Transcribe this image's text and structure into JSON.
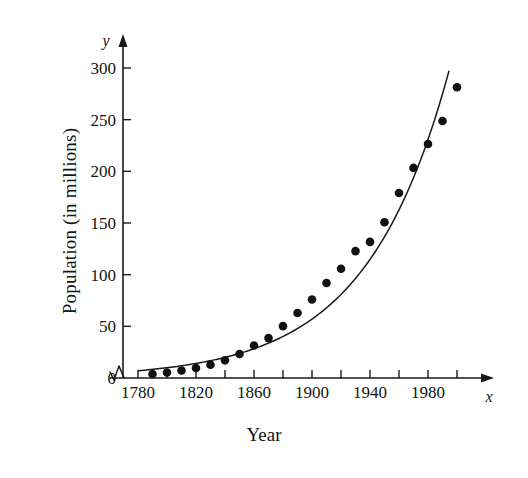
{
  "figure": {
    "background_color": "#ffffff",
    "ink_color": "#1a1a1a",
    "axis_variable_x": "x",
    "axis_variable_y": "y",
    "x_axis_title": "Year",
    "y_axis_title": "Population (in millions)"
  },
  "chart_data": {
    "type": "scatter",
    "title": "",
    "subtitle": "",
    "xlabel": "Year",
    "ylabel": "Population (in millions)",
    "xlim": [
      1780,
      2005
    ],
    "ylim": [
      0,
      310
    ],
    "grid": false,
    "legend": "none",
    "axis_break_x": true,
    "x_tick_labels": [
      "1780",
      "1820",
      "1860",
      "1900",
      "1940",
      "1980"
    ],
    "x_major_ticks": [
      1780,
      1820,
      1860,
      1900,
      1940,
      1980
    ],
    "x_minor_ticks": [
      1800,
      1820,
      1840,
      1860,
      1880,
      1900,
      1920,
      1940,
      1960,
      1980,
      2000
    ],
    "x_tick_interval": 20,
    "y_tick_labels": [
      "0",
      "50",
      "100",
      "150",
      "200",
      "250",
      "300"
    ],
    "y_ticks": [
      0,
      50,
      100,
      150,
      200,
      250,
      300
    ],
    "y_tick_interval": 50,
    "series": [
      {
        "name": "Population data points",
        "type": "scatter",
        "marker": "filled-circle",
        "color": "#111111",
        "x": [
          1790,
          1800,
          1810,
          1820,
          1830,
          1840,
          1850,
          1860,
          1870,
          1880,
          1890,
          1900,
          1910,
          1920,
          1930,
          1940,
          1950,
          1960,
          1970,
          1980,
          1990,
          2000
        ],
        "values": [
          3.9,
          5.3,
          7.2,
          9.6,
          12.9,
          17.1,
          23.2,
          31.4,
          38.6,
          50.2,
          62.9,
          76.0,
          92.0,
          105.7,
          122.8,
          131.7,
          150.7,
          179.0,
          203.3,
          226.5,
          248.7,
          281.4
        ]
      },
      {
        "name": "Exponential model curve",
        "type": "line",
        "color": "#111111",
        "x_start": 1780,
        "x_end": 1995,
        "y_start": 7,
        "y_end": 300,
        "x": [
          1780,
          1800,
          1820,
          1840,
          1860,
          1880,
          1900,
          1920,
          1940,
          1960,
          1980,
          1995
        ],
        "values": [
          7,
          8,
          10,
          13,
          18,
          26,
          40,
          63,
          101,
          167,
          264,
          300
        ]
      }
    ]
  }
}
